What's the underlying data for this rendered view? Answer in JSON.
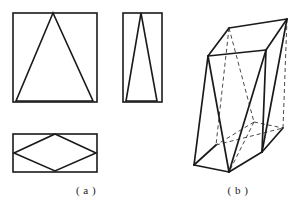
{
  "figure": {
    "background_color": "#ffffff",
    "line_color": "#1a1a1a",
    "hidden_line_color": "#4a4a4a",
    "captions": {
      "left": "( a )",
      "right": "( b )"
    }
  },
  "views": {
    "front_view": {
      "name": "front-view",
      "description": "Rectangle with inscribed isosceles triangle",
      "rect": {
        "x": 13,
        "y": 13,
        "width": 84,
        "height": 89
      },
      "triangle": [
        [
          53,
          13
        ],
        [
          16,
          101
        ],
        [
          93,
          101
        ]
      ]
    },
    "side_view": {
      "name": "side-view",
      "description": "Narrow rectangle with inscribed narrow triangle",
      "rect": {
        "x": 123,
        "y": 13,
        "width": 39,
        "height": 89
      },
      "triangle": [
        [
          141,
          13
        ],
        [
          126,
          101
        ],
        [
          157,
          101
        ]
      ]
    },
    "top_view": {
      "name": "top-view",
      "description": "Rectangle with inscribed rhombus",
      "rect": {
        "x": 13,
        "y": 134,
        "width": 84,
        "height": 38
      },
      "rhombus": [
        [
          55,
          134
        ],
        [
          96,
          153
        ],
        [
          55,
          171
        ],
        [
          14,
          153
        ]
      ]
    },
    "pictorial_view": {
      "name": "pictorial-view",
      "description": "Three-dimensional prism drawn in oblique projection with visible and hidden edges",
      "vertices": {
        "top_back_left": [
          229,
          28
        ],
        "top_back_right": [
          287,
          19
        ],
        "top_front_left": [
          208,
          56
        ],
        "top_front_right": [
          266,
          50
        ],
        "bottom_back_left": [
          216,
          145
        ],
        "bottom_back_right": [
          283,
          128
        ],
        "bottom_front_left": [
          194,
          165
        ],
        "bottom_front_right": [
          262,
          152
        ],
        "apex_front": [
          229,
          172
        ],
        "apex_back": [
          254,
          122
        ]
      },
      "solid_edges": [
        [
          [
            229,
            28
          ],
          [
            287,
            19
          ]
        ],
        [
          [
            287,
            19
          ],
          [
            266,
            50
          ]
        ],
        [
          [
            266,
            50
          ],
          [
            208,
            56
          ]
        ],
        [
          [
            208,
            56
          ],
          [
            229,
            28
          ]
        ],
        [
          [
            208,
            56
          ],
          [
            194,
            165
          ]
        ],
        [
          [
            287,
            19
          ],
          [
            262,
            152
          ]
        ],
        [
          [
            266,
            50
          ],
          [
            262,
            152
          ]
        ],
        [
          [
            194,
            165
          ],
          [
            229,
            172
          ]
        ],
        [
          [
            229,
            172
          ],
          [
            262,
            152
          ]
        ],
        [
          [
            229,
            172
          ],
          [
            208,
            56
          ]
        ],
        [
          [
            229,
            172
          ],
          [
            266,
            50
          ]
        ],
        [
          [
            194,
            165
          ],
          [
            216,
            145
          ]
        ],
        [
          [
            262,
            152
          ],
          [
            283,
            128
          ]
        ]
      ],
      "hidden_edges": [
        [
          [
            229,
            28
          ],
          [
            216,
            145
          ]
        ],
        [
          [
            216,
            145
          ],
          [
            283,
            128
          ]
        ],
        [
          [
            283,
            128
          ],
          [
            287,
            19
          ]
        ],
        [
          [
            229,
            28
          ],
          [
            254,
            122
          ]
        ],
        [
          [
            254,
            122
          ],
          [
            216,
            145
          ]
        ],
        [
          [
            254,
            122
          ],
          [
            283,
            128
          ]
        ],
        [
          [
            254,
            122
          ],
          [
            229,
            172
          ]
        ]
      ]
    }
  }
}
